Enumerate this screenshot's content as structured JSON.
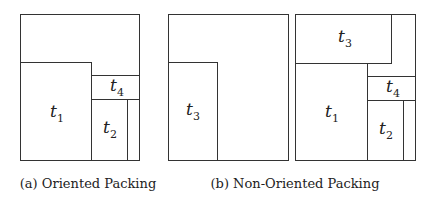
{
  "figure": {
    "panels": [
      {
        "id": "a",
        "caption": "(a) Oriented Packing",
        "rects": [
          {
            "name": "t1",
            "label": "t",
            "sub": "1"
          },
          {
            "name": "t4",
            "label": "t",
            "sub": "4"
          },
          {
            "name": "t2",
            "label": "t",
            "sub": "2"
          }
        ]
      },
      {
        "id": "b",
        "caption": "(b) Non-Oriented Packing",
        "left": {
          "rects": [
            {
              "name": "t3",
              "label": "t",
              "sub": "3"
            }
          ]
        },
        "right": {
          "rects": [
            {
              "name": "t3",
              "label": "t",
              "sub": "3"
            },
            {
              "name": "t1",
              "label": "t",
              "sub": "1"
            },
            {
              "name": "t4",
              "label": "t",
              "sub": "4"
            },
            {
              "name": "t2",
              "label": "t",
              "sub": "2"
            }
          ]
        }
      }
    ]
  }
}
